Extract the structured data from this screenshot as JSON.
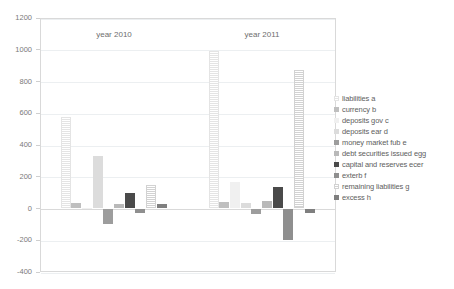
{
  "chart_data": {
    "type": "bar",
    "title": "",
    "subtitle": "",
    "xlabel": "",
    "ylabel": "",
    "categories": [
      "year 2010",
      "year 2011"
    ],
    "ylim": [
      -400,
      1200
    ],
    "ytick_values": [
      1200,
      1000,
      800,
      600,
      400,
      200,
      0,
      -200,
      -400
    ],
    "ytick_labels": [
      "1200",
      "1000",
      "800",
      "600",
      "400",
      "200",
      "0",
      "-200",
      "-400"
    ],
    "grid": true,
    "legend_position": "right",
    "series": [
      {
        "name": "liabilities a",
        "color": "#e4e4e4",
        "pattern": "dotted",
        "values": [
          575,
          995
        ]
      },
      {
        "name": "currency b",
        "color": "#bfbfbf",
        "pattern": "solid",
        "values": [
          35,
          40
        ]
      },
      {
        "name": "deposits gov c",
        "color": "#f0f0f0",
        "pattern": "solid",
        "values": [
          5,
          170
        ]
      },
      {
        "name": "deposits ear d",
        "color": "#dcdcdc",
        "pattern": "solid",
        "values": [
          330,
          35
        ]
      },
      {
        "name": "money market fub e",
        "color": "#9d9d9d",
        "pattern": "solid",
        "values": [
          -95,
          -35
        ]
      },
      {
        "name": "debt securities issued egg",
        "color": "#b9b9b9",
        "pattern": "solid",
        "values": [
          30,
          45
        ]
      },
      {
        "name": "capital and reserves ecer",
        "color": "#4a4a4a",
        "pattern": "solid",
        "values": [
          95,
          135
        ]
      },
      {
        "name": "exterb f",
        "color": "#8f8f8f",
        "pattern": "solid",
        "values": [
          -30,
          -200
        ]
      },
      {
        "name": "remaining liabilities g",
        "color": "#d2d2d2",
        "pattern": "dotted",
        "values": [
          150,
          870
        ]
      },
      {
        "name": "excess h",
        "color": "#7f7f7f",
        "pattern": "solid",
        "values": [
          30,
          -30
        ]
      }
    ]
  }
}
